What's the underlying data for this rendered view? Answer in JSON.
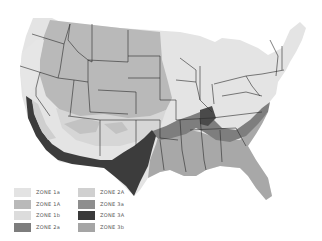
{
  "map": {
    "title": "",
    "region": "Contiguous United States",
    "zones": [
      {
        "id": "zone-1a-light",
        "label": "ZONE 1a",
        "color": "#e3e3e3"
      },
      {
        "id": "zone-1A",
        "label": "ZONE 1A",
        "color": "#b9b9b9"
      },
      {
        "id": "zone-1b",
        "label": "ZONE 1b",
        "color": "#dcdcdc"
      },
      {
        "id": "zone-2a",
        "label": "ZONE 2a",
        "color": "#7d7d7d"
      },
      {
        "id": "zone-2A",
        "label": "ZONE 2A",
        "color": "#d0d0d0"
      },
      {
        "id": "zone-3a",
        "label": "ZONE 3a",
        "color": "#8e8e8e"
      },
      {
        "id": "zone-3A",
        "label": "ZONE 3A",
        "color": "#3a3a3a"
      },
      {
        "id": "zone-3b",
        "label": "ZONE 3b",
        "color": "#a5a5a5"
      }
    ]
  },
  "legend": {
    "col1": [
      "ZONE 1a",
      "ZONE 1A",
      "ZONE 1b",
      "ZONE 2a"
    ],
    "col2": [
      "ZONE 2A",
      "ZONE 3a",
      "ZONE 3A",
      "ZONE 3b"
    ]
  }
}
